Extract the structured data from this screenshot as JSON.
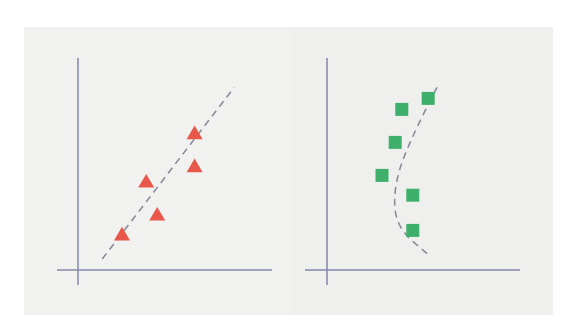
{
  "colors": {
    "background": "#ffffff",
    "panel": "#f1f1ef",
    "axis": "#8587a8",
    "fit_line": "#8a8c9c",
    "triangle": "#e8584a",
    "square": "#3fb06b"
  },
  "chart_data": [
    {
      "type": "scatter",
      "title": "",
      "xlabel": "",
      "ylabel": "",
      "marker": "triangle",
      "color": "#e8584a",
      "grid": false,
      "legend": null,
      "ticks": "none",
      "fit": "linear (dashed)",
      "points": [
        {
          "x": 2.0,
          "y": 1.6
        },
        {
          "x": 3.1,
          "y": 4.0
        },
        {
          "x": 3.6,
          "y": 2.5
        },
        {
          "x": 5.3,
          "y": 6.2
        },
        {
          "x": 5.3,
          "y": 4.7
        }
      ],
      "fit_line": [
        {
          "x": 1.1,
          "y": 0.5
        },
        {
          "x": 7.1,
          "y": 8.3
        }
      ],
      "xlim": [
        0,
        8.2
      ],
      "ylim": [
        0,
        9.5
      ]
    },
    {
      "type": "scatter",
      "title": "",
      "xlabel": "",
      "ylabel": "",
      "marker": "square",
      "color": "#3fb06b",
      "grid": false,
      "legend": null,
      "ticks": "none",
      "fit": "curved (dashed, concave left)",
      "points": [
        {
          "x": 3.4,
          "y": 7.3
        },
        {
          "x": 4.6,
          "y": 7.8
        },
        {
          "x": 3.1,
          "y": 5.8
        },
        {
          "x": 2.5,
          "y": 4.3
        },
        {
          "x": 3.9,
          "y": 3.4
        },
        {
          "x": 3.9,
          "y": 1.8
        }
      ],
      "fit_curve": [
        {
          "x": 5.0,
          "y": 8.3
        },
        {
          "x": 3.6,
          "y": 5.6
        },
        {
          "x": 3.0,
          "y": 3.5
        },
        {
          "x": 3.2,
          "y": 1.9
        },
        {
          "x": 4.6,
          "y": 0.7
        }
      ],
      "xlim": [
        0,
        8.2
      ],
      "ylim": [
        0,
        9.5
      ]
    }
  ]
}
